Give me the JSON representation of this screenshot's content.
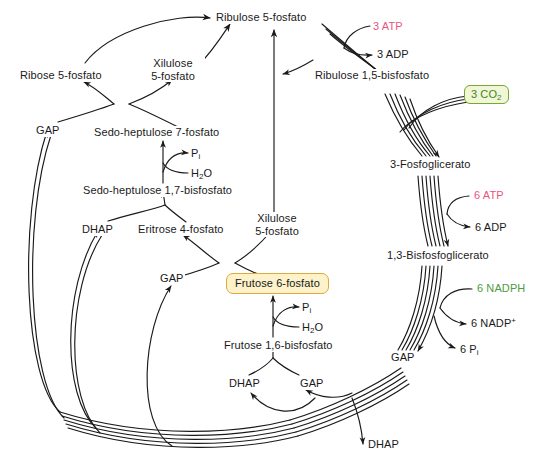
{
  "diagram": {
    "colors": {
      "line": "#1a1a1a",
      "text": "#1a1a1a",
      "atp_pink": "#e8557f",
      "nadph_green": "#4f9b3f",
      "co2_box_fill": "#f0f6d6",
      "co2_box_border": "#76a832",
      "co2_text": "#3f8426",
      "f6p_box_fill": "#fdf2c9",
      "f6p_box_border": "#e0a93b",
      "background": "#ffffff"
    },
    "metabolites": {
      "ribulose_5_phosphate": "Ribulose 5-fosfato",
      "ribose_5_phosphate": "Ribose 5-fosfato",
      "xilulose_5_phosphate_top_line1": "Xilulose",
      "xilulose_5_phosphate_top_line2": "5-fosfato",
      "xilulose_5_phosphate_mid_line1": "Xilulose",
      "xilulose_5_phosphate_mid_line2": "5-fosfato",
      "ribulose_1_5_bisphosphate": "Ribulose 1,5-bisfosfato",
      "three_phosphoglycerate": "3-Fosfoglicerato",
      "one_three_bisphosphoglycerate": "1,3-Bisfosfoglicerato",
      "sedoheptulose_7_phosphate": "Sedo-heptulose 7-fosfato",
      "sedoheptulose_1_7_bisphosphate": "Sedo-heptulose 1,7-bisfosfato",
      "erythrose_4_phosphate": "Eritrose 4-fosfato",
      "fructose_6_phosphate": "Frutose 6-fosfato",
      "fructose_1_6_bisphosphate": "Frutose 1,6-bisfosfato",
      "gap_upper_left": "GAP",
      "gap_center": "GAP",
      "gap_bottom_center": "GAP",
      "gap_right": "GAP",
      "dhap_left": "DHAP",
      "dhap_bottom_center": "DHAP",
      "dhap_output": "DHAP"
    },
    "cofactors": {
      "atp_3": "3 ATP",
      "adp_3": "3 ADP",
      "atp_6": "6 ATP",
      "adp_6": "6 ADP",
      "nadph_6": "6 NADPH",
      "nadp_plus_6_prefix": "6 NADP",
      "nadp_plus_6_sup": "+",
      "pi_6_prefix": "6 P",
      "pi_6_sub": "i",
      "co2_3_prefix": "3 CO",
      "co2_3_sub": "2",
      "pi_top_prefix": "P",
      "pi_top_sub": "i",
      "pi_lower_prefix": "P",
      "pi_lower_sub": "i",
      "water_top_prefix": "H",
      "water_top_sub": "2",
      "water_top_suffix": "O",
      "water_lower_prefix": "H",
      "water_lower_sub": "2",
      "water_lower_suffix": "O"
    }
  }
}
